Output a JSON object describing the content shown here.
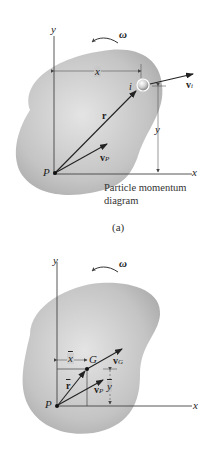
{
  "figure_a": {
    "axis_y": "y",
    "axis_x": "x",
    "omega": "ω",
    "dim_x": "x",
    "dim_y": "y",
    "particle": "i",
    "vel_i": "v",
    "vel_i_sub": "i",
    "pos_r": "r",
    "vel_p": "v",
    "vel_p_sub": "P",
    "point_p": "P",
    "caption_line1": "Particle momentum",
    "caption_line2": "diagram",
    "label": "(a)"
  },
  "figure_b": {
    "axis_y": "y",
    "axis_x": "x",
    "omega": "ω",
    "dim_xbar": "x",
    "dim_ybar": "y",
    "center": "G",
    "vel_g": "v",
    "vel_g_sub": "G",
    "pos_rbar": "r",
    "vel_p": "v",
    "vel_p_sub": "P",
    "point_p": "P"
  },
  "colors": {
    "body_fill": "#b9b9b9",
    "body_highlight": "#e2e2e2",
    "ink": "#222222"
  }
}
